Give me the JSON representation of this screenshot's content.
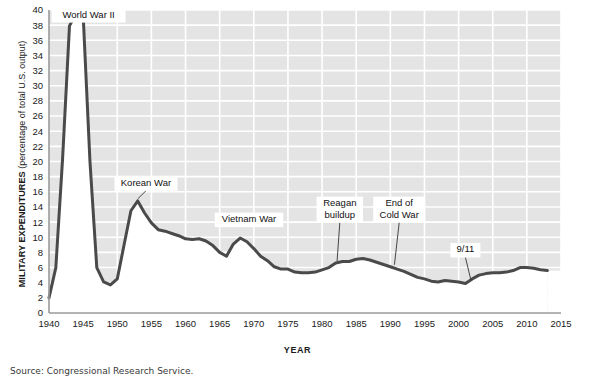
{
  "figure": {
    "source_note": "Source: Congressional Research Service.",
    "xlabel": "YEAR",
    "ylabel_strong": "MILITARY EXPENDITURES",
    "ylabel_normal": " (percentage of total U.S. output)"
  },
  "colors": {
    "line": "#4a4a4a",
    "plot_background": "#e4e4e4",
    "gridline": "#ffffff",
    "area_fill": "#ffffff",
    "axis": "#9a9a9a",
    "text": "#1a1a1a"
  },
  "chart_data": {
    "type": "line",
    "title": "",
    "subtitle": "",
    "xlabel": "YEAR",
    "ylabel": "MILITARY EXPENDITURES (percentage of total U.S. output)",
    "xlim": [
      1940,
      2015
    ],
    "ylim": [
      0,
      40
    ],
    "xticks": [
      1940,
      1945,
      1950,
      1955,
      1960,
      1965,
      1970,
      1975,
      1980,
      1985,
      1990,
      1995,
      2000,
      2005,
      2010,
      2015
    ],
    "yticks": [
      0,
      2,
      4,
      6,
      8,
      10,
      12,
      14,
      16,
      18,
      20,
      22,
      24,
      26,
      28,
      30,
      32,
      34,
      36,
      38,
      40
    ],
    "xtick_labels": [
      "1940",
      "1945",
      "1950",
      "1955",
      "1960",
      "1965",
      "1970",
      "1975",
      "1980",
      "1985",
      "1990",
      "1995",
      "2000",
      "2005",
      "2010",
      "2015"
    ],
    "ytick_labels": [
      "0",
      "2",
      "4",
      "6",
      "8",
      "10",
      "12",
      "14",
      "16",
      "18",
      "20",
      "22",
      "24",
      "26",
      "28",
      "30",
      "32",
      "34",
      "36",
      "38",
      "40"
    ],
    "grid": true,
    "legend": false,
    "area_filled_below": true,
    "series": [
      {
        "name": "Military expenditures as percentage of total U.S. output",
        "x": [
          1940,
          1941,
          1942,
          1943,
          1944,
          1945,
          1946,
          1947,
          1948,
          1949,
          1950,
          1951,
          1952,
          1953,
          1954,
          1955,
          1956,
          1957,
          1958,
          1959,
          1960,
          1961,
          1962,
          1963,
          1964,
          1965,
          1966,
          1967,
          1968,
          1969,
          1970,
          1971,
          1972,
          1973,
          1974,
          1975,
          1976,
          1977,
          1978,
          1979,
          1980,
          1981,
          1982,
          1983,
          1984,
          1985,
          1986,
          1987,
          1988,
          1989,
          1990,
          1991,
          1992,
          1993,
          1994,
          1995,
          1996,
          1997,
          1998,
          1999,
          2000,
          2001,
          2002,
          2003,
          2004,
          2005,
          2006,
          2007,
          2008,
          2009,
          2010,
          2011,
          2012,
          2013
        ],
        "y": [
          2.0,
          6.0,
          20.5,
          37.9,
          39.6,
          39.4,
          20.0,
          6.0,
          4.1,
          3.7,
          4.5,
          9.0,
          13.5,
          14.8,
          13.2,
          11.9,
          11.0,
          10.8,
          10.5,
          10.2,
          9.8,
          9.7,
          9.8,
          9.5,
          8.9,
          8.0,
          7.5,
          9.1,
          9.9,
          9.4,
          8.5,
          7.5,
          6.9,
          6.1,
          5.8,
          5.8,
          5.4,
          5.3,
          5.3,
          5.4,
          5.7,
          6.0,
          6.6,
          6.8,
          6.8,
          7.1,
          7.2,
          7.0,
          6.7,
          6.4,
          6.1,
          5.8,
          5.5,
          5.1,
          4.7,
          4.5,
          4.2,
          4.1,
          4.3,
          4.2,
          4.1,
          3.9,
          4.5,
          5.0,
          5.2,
          5.3,
          5.3,
          5.4,
          5.6,
          6.0,
          6.0,
          5.9,
          5.7,
          5.6
        ]
      }
    ],
    "annotations": [
      {
        "label": "World War II",
        "lines": [
          "World War II"
        ],
        "x": 1945.8,
        "y": 38.6,
        "target_x": 1944.3,
        "target_y": 39.4,
        "leader": false
      },
      {
        "label": "Korean War",
        "lines": [
          "Korean War"
        ],
        "x": 1954.2,
        "y": 16.4,
        "target_x": 1953.0,
        "target_y": 14.8,
        "leader": true
      },
      {
        "label": "Vietnam War",
        "lines": [
          "Vietnam War"
        ],
        "x": 1969.3,
        "y": 11.6,
        "target_x": 1968.0,
        "target_y": 9.9,
        "leader": false
      },
      {
        "label": "Reagan buildup",
        "lines": [
          "Reagan",
          "buildup"
        ],
        "x": 1982.6,
        "y": 12.2,
        "target_x": 1982.2,
        "target_y": 6.6,
        "leader": true
      },
      {
        "label": "End of Cold War",
        "lines": [
          "End of",
          "Cold War"
        ],
        "x": 1991.3,
        "y": 12.2,
        "target_x": 1990.6,
        "target_y": 6.1,
        "leader": true
      },
      {
        "label": "9/11",
        "lines": [
          "9/11"
        ],
        "x": 2001.0,
        "y": 7.6,
        "target_x": 2001.8,
        "target_y": 4.1,
        "leader": true
      }
    ]
  }
}
